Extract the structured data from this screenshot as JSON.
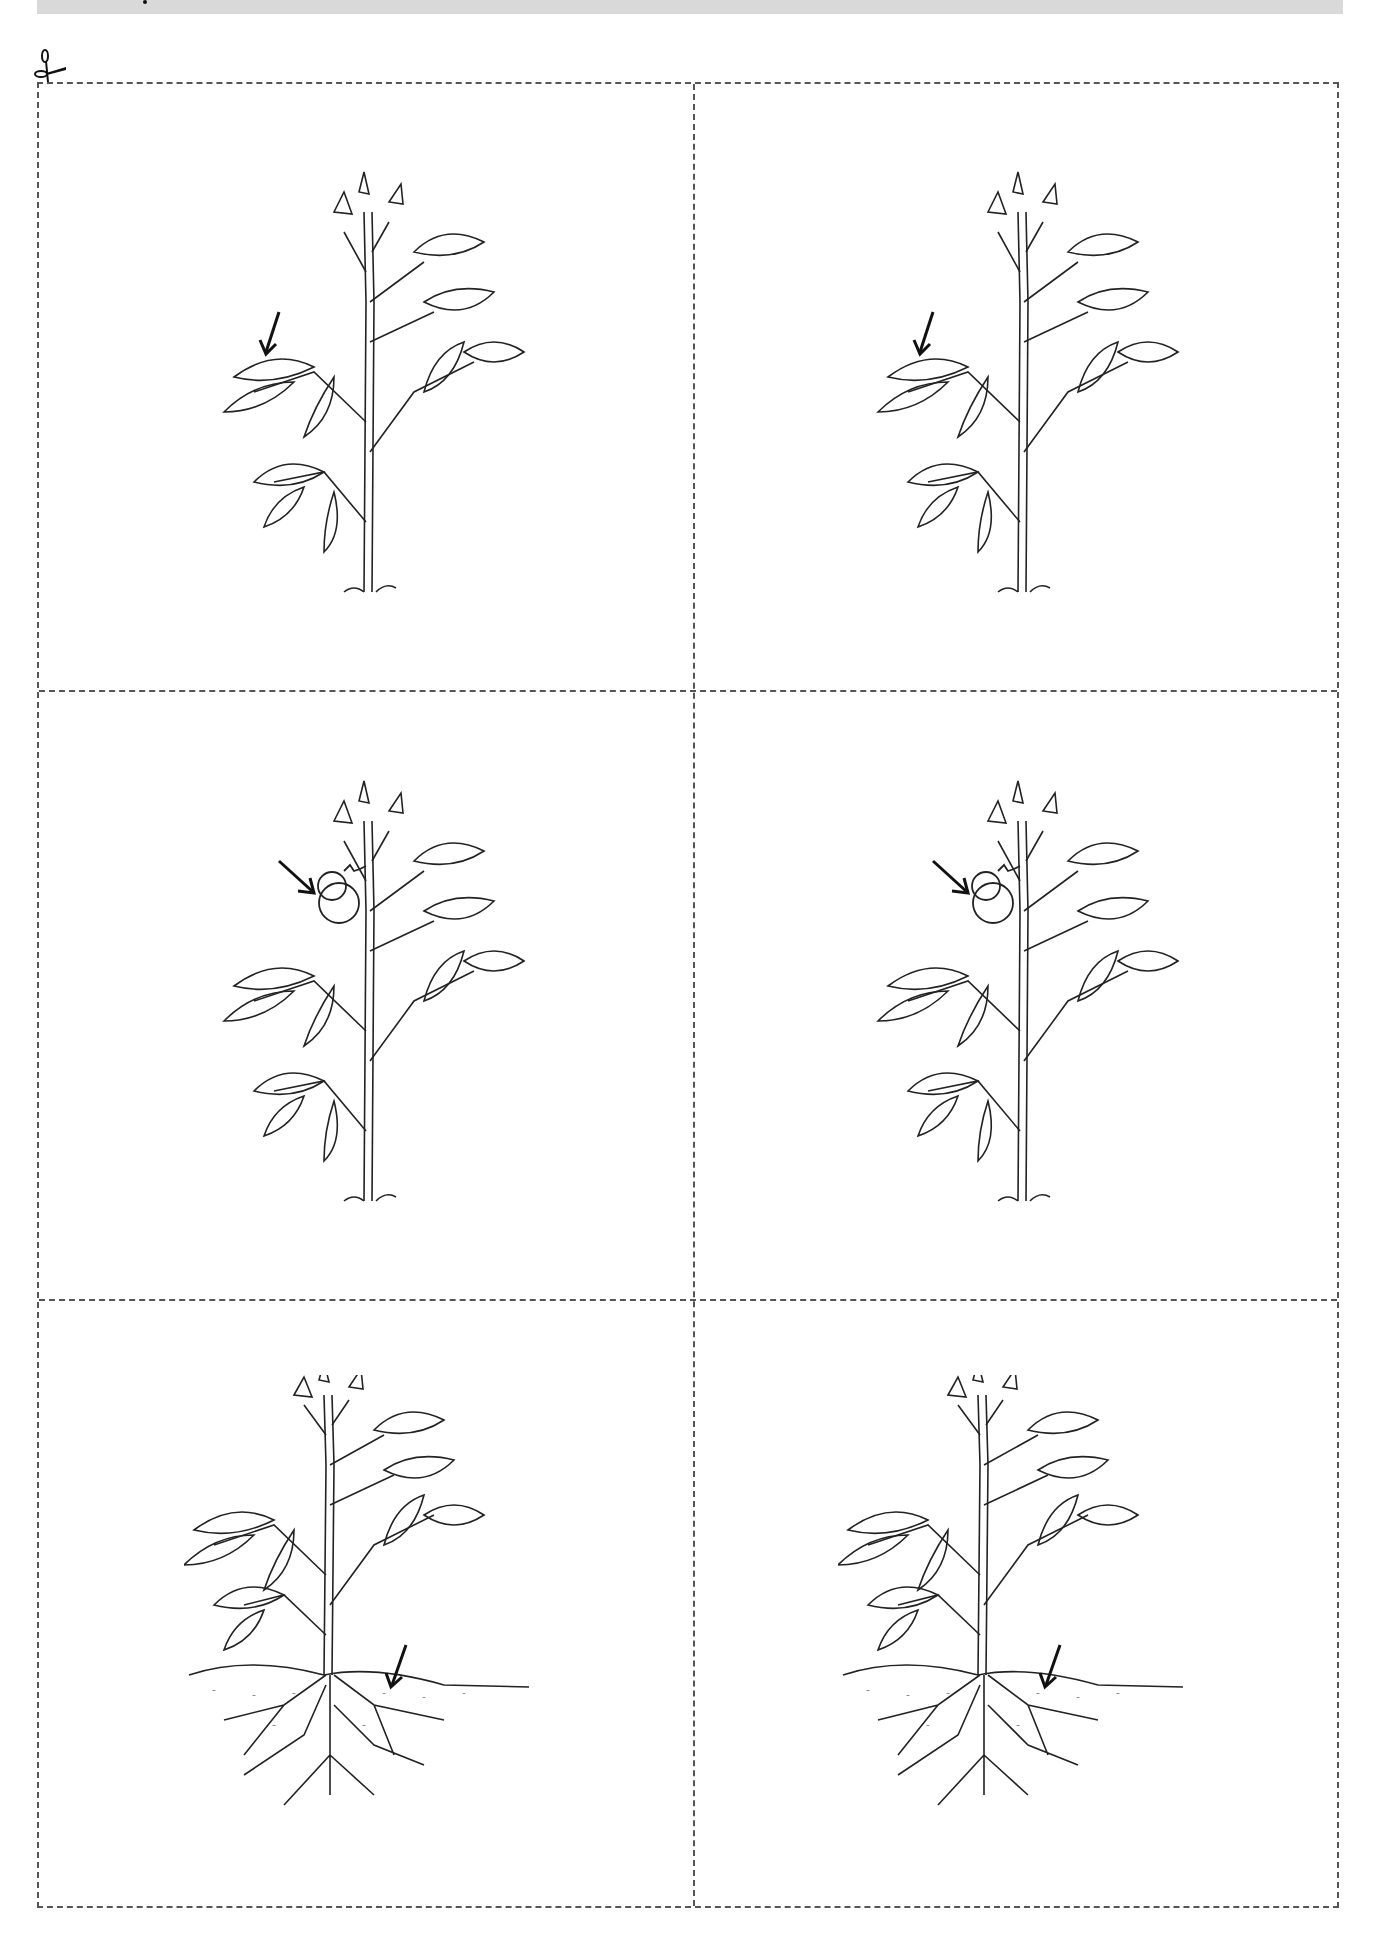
{
  "page": {
    "type": "cut-out cards worksheet",
    "banner": {
      "color": "#d9d9d9",
      "text": ""
    },
    "cut_line": {
      "style": "dashed",
      "color": "#555555",
      "icon": "scissors-icon"
    }
  },
  "cards": [
    {
      "row": 1,
      "col": 1,
      "subject": "plant",
      "highlighted_part": "leaf",
      "arrow_direction": "down-left",
      "features": [
        "stem",
        "leaves",
        "grass"
      ]
    },
    {
      "row": 1,
      "col": 2,
      "subject": "plant",
      "highlighted_part": "leaf",
      "arrow_direction": "down-left",
      "features": [
        "stem",
        "leaves",
        "grass"
      ]
    },
    {
      "row": 2,
      "col": 1,
      "subject": "plant",
      "highlighted_part": "fruit",
      "arrow_direction": "down-right",
      "features": [
        "stem",
        "leaves",
        "tomato",
        "grass"
      ]
    },
    {
      "row": 2,
      "col": 2,
      "subject": "plant",
      "highlighted_part": "fruit",
      "arrow_direction": "down-right",
      "features": [
        "stem",
        "leaves",
        "tomato",
        "grass"
      ]
    },
    {
      "row": 3,
      "col": 1,
      "subject": "plant",
      "highlighted_part": "roots",
      "arrow_direction": "down-left",
      "features": [
        "stem",
        "leaves",
        "soil",
        "roots"
      ]
    },
    {
      "row": 3,
      "col": 2,
      "subject": "plant",
      "highlighted_part": "roots",
      "arrow_direction": "down-left",
      "features": [
        "stem",
        "leaves",
        "soil",
        "roots"
      ]
    }
  ],
  "colors": {
    "ink": "#222222",
    "arrow": "#111111",
    "background": "#ffffff"
  }
}
